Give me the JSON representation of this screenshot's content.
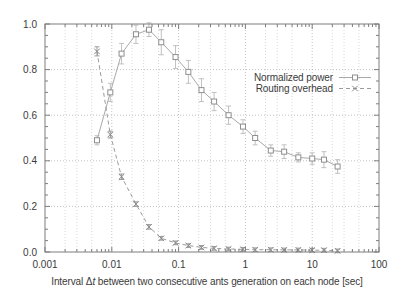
{
  "chart_data": {
    "type": "line",
    "title": "",
    "xlabel": "Interval Δt between two consecutive ants generation on each node [sec]",
    "xlabel_parts": {
      "prefix": "Interval Δ",
      "italic": "t",
      "suffix": " between two consecutive ants generation on each node [sec]"
    },
    "ylabel": "",
    "x_scale": "log",
    "y_scale": "linear",
    "xlim": [
      0.001,
      100
    ],
    "ylim": [
      0.0,
      1.0
    ],
    "x_ticks": [
      0.001,
      0.01,
      0.1,
      1,
      10,
      100
    ],
    "x_tick_labels": [
      "0.001",
      "0.01",
      "0.1",
      "1",
      "10",
      "100"
    ],
    "y_ticks": [
      0.0,
      0.2,
      0.4,
      0.6,
      0.8,
      1.0
    ],
    "y_tick_labels": [
      "0.0",
      "0.2",
      "0.4",
      "0.6",
      "0.8",
      "1.0"
    ],
    "grid": true,
    "grid_minor_multipliers": [
      2,
      3,
      5
    ],
    "legend_position": "inside-right-upper",
    "x": [
      0.006,
      0.0095,
      0.014,
      0.023,
      0.036,
      0.055,
      0.09,
      0.14,
      0.22,
      0.34,
      0.56,
      0.92,
      1.4,
      2.4,
      3.8,
      6.2,
      10,
      15,
      24
    ],
    "series": [
      {
        "name": "Normalized power",
        "marker": "square",
        "line_style": "solid",
        "y": [
          0.49,
          0.7,
          0.87,
          0.955,
          0.975,
          0.92,
          0.855,
          0.79,
          0.71,
          0.66,
          0.6,
          0.55,
          0.5,
          0.445,
          0.44,
          0.415,
          0.41,
          0.405,
          0.375
        ],
        "yerr": [
          0.02,
          0.04,
          0.045,
          0.04,
          0.03,
          0.055,
          0.05,
          0.05,
          0.05,
          0.04,
          0.04,
          0.03,
          0.03,
          0.025,
          0.03,
          0.02,
          0.025,
          0.035,
          0.03
        ]
      },
      {
        "name": "Routing overhead",
        "marker": "x",
        "line_style": "dashed",
        "y": [
          0.88,
          0.515,
          0.33,
          0.21,
          0.11,
          0.06,
          0.04,
          0.028,
          0.02,
          0.016,
          0.013,
          0.012,
          0.01,
          0.01,
          0.009,
          0.009,
          0.008,
          0.008,
          0.005
        ],
        "yerr": [
          0.02,
          0.015,
          0.012,
          0.01,
          0.01,
          0.008,
          0.008,
          0.008,
          0.008,
          0.008,
          0.008,
          0.008,
          0.008,
          0.008,
          0.008,
          0.008,
          0.008,
          0.008,
          0.008
        ]
      }
    ],
    "colors": {
      "background": "#ffffff",
      "frame": "#7d7d7d",
      "grid_major": "#c2c2c2",
      "grid_minor": "#d9d9d9",
      "series1_line": "#a9a9a9",
      "series1_marker": "#8f8f8f",
      "series1_errorbar": "#c0c0c0",
      "series2_line": "#9b9b9b",
      "series2_marker": "#8a8a8a",
      "text": "#3a3a3a"
    }
  }
}
